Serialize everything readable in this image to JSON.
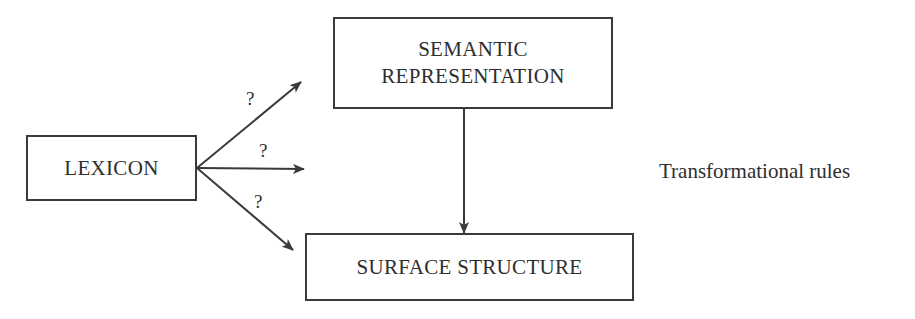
{
  "diagram": {
    "nodes": {
      "lexicon": {
        "label": "LEXICON"
      },
      "semantic": {
        "line1": "SEMANTIC",
        "line2": "REPRESENTATION"
      },
      "surface": {
        "label": "SURFACE STRUCTURE"
      }
    },
    "edges": [
      {
        "from": "lexicon",
        "to": "semantic-direction",
        "label": "?"
      },
      {
        "from": "lexicon",
        "to": "right",
        "label": "?"
      },
      {
        "from": "lexicon",
        "to": "surface",
        "label": "?"
      },
      {
        "from": "semantic",
        "to": "surface",
        "label": ""
      }
    ],
    "annotation": "Transformational rules"
  }
}
